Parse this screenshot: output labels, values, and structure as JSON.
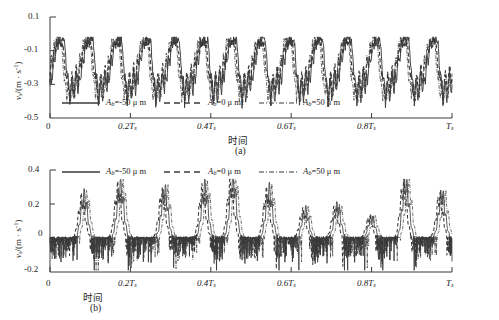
{
  "figure": {
    "background": "#ffffff",
    "line_color": "#3a3a3a"
  },
  "panels": [
    {
      "id": "a",
      "caption": "(a)",
      "ylabel_main": "v",
      "ylabel_sub": "s",
      "ylabel_rest": "/(m · s",
      "ylabel_sup": "-1",
      "ylabel_close": ")",
      "xaxis_title": "时间",
      "yticks": [
        "0.1",
        "-0.1",
        "-0.3",
        "-0.5"
      ],
      "xticks": [
        "0",
        "0.2T",
        "0.4T",
        "0.6T",
        "0.8T",
        "T"
      ],
      "xtick_sub": "s",
      "legend": [
        {
          "style": "solid",
          "label_var": "A",
          "label_sub": "b",
          "label_rest": "=-50 μ m"
        },
        {
          "style": "dashed",
          "label_var": "A",
          "label_sub": "b",
          "label_rest": "=0 μ m"
        },
        {
          "style": "dashdot",
          "label_var": "A",
          "label_sub": "b",
          "label_rest": "=50 μ m"
        }
      ]
    },
    {
      "id": "b",
      "caption": "(b)",
      "ylabel_main": "v",
      "ylabel_sub": "s",
      "ylabel_rest": "/(m · s",
      "ylabel_sup": "-1",
      "ylabel_close": ")",
      "xaxis_title": "时间",
      "yticks": [
        "0.4",
        "0.2",
        "0",
        "-0.2"
      ],
      "xticks": [
        "0",
        "0.2T",
        "0.4T",
        "0.6T",
        "0.8T",
        "T"
      ],
      "xtick_sub": "s",
      "legend": [
        {
          "style": "solid",
          "label_var": "A",
          "label_sub": "b",
          "label_rest": "=-50 μ m"
        },
        {
          "style": "dashed",
          "label_var": "A",
          "label_sub": "b",
          "label_rest": "=0 μ m"
        },
        {
          "style": "dashdot",
          "label_var": "A",
          "label_sub": "b",
          "label_rest": "=50 μ m"
        }
      ]
    }
  ],
  "chart_data": [
    {
      "type": "line",
      "panel": "a",
      "title": "",
      "xlabel": "时间",
      "ylabel": "v_s/(m·s^-1)",
      "xlim": [
        0,
        1
      ],
      "ylim": [
        -0.5,
        0.1
      ],
      "yticks": [
        -0.5,
        -0.3,
        -0.1,
        0.1
      ],
      "xticks": [
        0,
        0.2,
        0.4,
        0.6,
        0.8,
        1.0
      ],
      "xtick_labels": [
        "0",
        "0.2Ts",
        "0.4Ts",
        "0.6Ts",
        "0.8Ts",
        "Ts"
      ],
      "grid": false,
      "legend_position": "bottom-inside",
      "description": "Three overlapping noisy quasi-periodic velocity traces oscillating between about -0.40 and -0.02, roughly 14 cycles across the time axis, with flat-topped plateaus near -0.03 and sharp descents to -0.35.",
      "series": [
        {
          "name": "A_b=-50 μ m",
          "style": "solid",
          "values": [
            -0.2,
            -0.24,
            -0.19,
            -0.27,
            -0.22,
            -0.17,
            -0.13,
            -0.09,
            -0.14,
            -0.11,
            -0.16,
            -0.12,
            -0.08,
            -0.03,
            -0.03,
            -0.03,
            -0.1,
            -0.17,
            -0.24,
            -0.31,
            -0.36,
            -0.28,
            -0.21,
            -0.16,
            -0.12,
            -0.16,
            -0.12,
            -0.17,
            -0.13,
            -0.09,
            -0.12,
            -0.09,
            -0.14,
            -0.1,
            -0.05,
            -0.03,
            -0.03,
            -0.03,
            -0.09,
            -0.16,
            -0.23,
            -0.3,
            -0.35,
            -0.27,
            -0.2,
            -0.15,
            -0.11,
            -0.15,
            -0.11,
            -0.16,
            -0.12,
            -0.08,
            -0.04,
            -0.03,
            -0.03,
            -0.03,
            -0.11,
            -0.19,
            -0.26,
            -0.33,
            -0.38,
            -0.3,
            -0.22,
            -0.16,
            -0.12,
            -0.16,
            -0.13,
            -0.18,
            -0.14,
            -0.1,
            -0.06,
            -0.03,
            -0.03,
            -0.03,
            -0.1,
            -0.18,
            -0.25,
            -0.32,
            -0.36,
            -0.28,
            -0.21,
            -0.15,
            -0.11,
            -0.15,
            -0.12,
            -0.17,
            -0.13,
            -0.09,
            -0.05,
            -0.03,
            -0.03,
            -0.03,
            -0.11,
            -0.18,
            -0.25,
            -0.31,
            -0.36,
            -0.28,
            -0.2,
            -0.15
          ]
        },
        {
          "name": "A_b=0 μ m",
          "style": "dashed",
          "values": [
            -0.22,
            -0.26,
            -0.21,
            -0.25,
            -0.2,
            -0.15,
            -0.11,
            -0.07,
            -0.12,
            -0.09,
            -0.14,
            -0.1,
            -0.06,
            -0.05,
            -0.05,
            -0.07,
            -0.13,
            -0.2,
            -0.27,
            -0.33,
            -0.34,
            -0.26,
            -0.19,
            -0.14,
            -0.1,
            -0.14,
            -0.1,
            -0.15,
            -0.11,
            -0.07,
            -0.1,
            -0.07,
            -0.12,
            -0.08,
            -0.06,
            -0.05,
            -0.05,
            -0.06,
            -0.12,
            -0.19,
            -0.26,
            -0.32,
            -0.33,
            -0.25,
            -0.18,
            -0.13,
            -0.09,
            -0.13,
            -0.09,
            -0.14,
            -0.1,
            -0.06,
            -0.05,
            -0.05,
            -0.05,
            -0.06,
            -0.14,
            -0.22,
            -0.29,
            -0.35,
            -0.36,
            -0.28,
            -0.2,
            -0.14,
            -0.1,
            -0.14,
            -0.11,
            -0.16,
            -0.12,
            -0.08,
            -0.05,
            -0.05,
            -0.05,
            -0.06,
            -0.13,
            -0.21,
            -0.28,
            -0.34,
            -0.34,
            -0.26,
            -0.19,
            -0.13,
            -0.09,
            -0.13,
            -0.1,
            -0.15,
            -0.11,
            -0.07,
            -0.05,
            -0.05,
            -0.05,
            -0.06,
            -0.14,
            -0.21,
            -0.28,
            -0.33,
            -0.34,
            -0.26,
            -0.18,
            -0.13
          ]
        },
        {
          "name": "A_b=50 μ m",
          "style": "dashdot",
          "values": [
            -0.19,
            -0.23,
            -0.18,
            -0.26,
            -0.23,
            -0.18,
            -0.14,
            -0.1,
            -0.15,
            -0.12,
            -0.17,
            -0.13,
            -0.09,
            -0.04,
            -0.04,
            -0.06,
            -0.12,
            -0.19,
            -0.26,
            -0.32,
            -0.38,
            -0.3,
            -0.22,
            -0.17,
            -0.13,
            -0.17,
            -0.13,
            -0.18,
            -0.14,
            -0.1,
            -0.13,
            -0.1,
            -0.15,
            -0.11,
            -0.06,
            -0.04,
            -0.04,
            -0.05,
            -0.11,
            -0.18,
            -0.25,
            -0.31,
            -0.37,
            -0.29,
            -0.21,
            -0.16,
            -0.12,
            -0.16,
            -0.12,
            -0.17,
            -0.13,
            -0.09,
            -0.05,
            -0.04,
            -0.04,
            -0.05,
            -0.13,
            -0.21,
            -0.28,
            -0.34,
            -0.4,
            -0.32,
            -0.23,
            -0.17,
            -0.13,
            -0.17,
            -0.14,
            -0.19,
            -0.15,
            -0.11,
            -0.07,
            -0.04,
            -0.04,
            -0.05,
            -0.12,
            -0.2,
            -0.27,
            -0.33,
            -0.38,
            -0.3,
            -0.22,
            -0.16,
            -0.12,
            -0.16,
            -0.13,
            -0.18,
            -0.14,
            -0.1,
            -0.06,
            -0.04,
            -0.04,
            -0.05,
            -0.13,
            -0.2,
            -0.27,
            -0.32,
            -0.38,
            -0.29,
            -0.21,
            -0.16
          ]
        }
      ]
    },
    {
      "type": "line",
      "panel": "b",
      "title": "",
      "xlabel": "时间",
      "ylabel": "v_s/(m·s^-1)",
      "xlim": [
        0,
        1
      ],
      "ylim": [
        -0.2,
        0.4
      ],
      "yticks": [
        -0.2,
        0,
        0.2,
        0.4
      ],
      "xticks": [
        0,
        0.2,
        0.4,
        0.6,
        0.8,
        1.0
      ],
      "xtick_labels": [
        "0",
        "0.2Ts",
        "0.4Ts",
        "0.6Ts",
        "0.8Ts",
        "Ts"
      ],
      "grid": false,
      "legend_position": "top-inside",
      "description": "Three overlapping traces hovering near zero with dense small negative noise spikes down to about -0.18, punctuated by ~8 tall narrow positive bursts reaching 0.20 to 0.33 at roughly periodic intervals.",
      "peaks": [
        {
          "x": 0.085,
          "height": 0.24
        },
        {
          "x": 0.175,
          "height": 0.3
        },
        {
          "x": 0.285,
          "height": 0.27
        },
        {
          "x": 0.385,
          "height": 0.29
        },
        {
          "x": 0.455,
          "height": 0.33
        },
        {
          "x": 0.545,
          "height": 0.27
        },
        {
          "x": 0.635,
          "height": 0.16
        },
        {
          "x": 0.715,
          "height": 0.18
        },
        {
          "x": 0.8,
          "height": 0.12
        },
        {
          "x": 0.885,
          "height": 0.32
        },
        {
          "x": 0.975,
          "height": 0.25
        }
      ],
      "baseline": 0.0,
      "noise_floor": -0.18
    }
  ]
}
